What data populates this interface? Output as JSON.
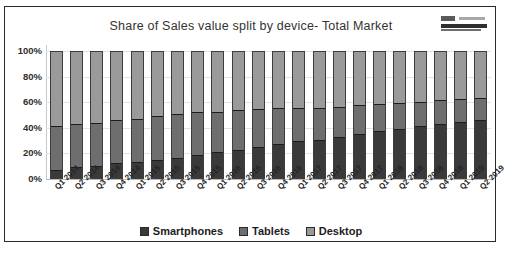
{
  "chart_data": {
    "type": "bar",
    "stacked": true,
    "stack_mode": "percent",
    "title": "Share of Sales value split by device- Total Market",
    "xlabel": "",
    "ylabel": "",
    "ylim": [
      0,
      100
    ],
    "ytick_labels": [
      "100%",
      "80%",
      "60%",
      "40%",
      "20%",
      "0%"
    ],
    "ytick_values": [
      100,
      80,
      60,
      40,
      20,
      0
    ],
    "grid": true,
    "legend_position": "bottom",
    "categories": [
      "Q1 2014",
      "Q2 2014",
      "Q3 2014",
      "Q4 2014",
      "Q1 2015",
      "Q2 2015",
      "Q3 2015",
      "Q4 2015",
      "Q1 2016",
      "Q2 2016",
      "Q3 2016",
      "Q4 2016",
      "Q1 2017",
      "Q2 2017",
      "Q3 2017",
      "Q4 2017",
      "Q1 2018",
      "Q2 2018",
      "Q3 2018",
      "Q4 2018",
      "Q1 2019",
      "Q2 2019"
    ],
    "series": [
      {
        "name": "Smartphones",
        "color": "#3a3a3a",
        "values": [
          6,
          8,
          9,
          11,
          12,
          14,
          15,
          18,
          20,
          22,
          24,
          27,
          29,
          30,
          32,
          35,
          37,
          39,
          41,
          43,
          44,
          46
        ]
      },
      {
        "name": "Tablets",
        "color": "#6e6e6e",
        "values": [
          34,
          34,
          34,
          34,
          34,
          34,
          35,
          34,
          32,
          31,
          30,
          28,
          26,
          25,
          24,
          22,
          21,
          20,
          19,
          18,
          18,
          17
        ]
      },
      {
        "name": "Desktop",
        "color": "#9a9a9a",
        "values": [
          60,
          58,
          57,
          55,
          54,
          52,
          50,
          48,
          48,
          47,
          46,
          45,
          45,
          45,
          44,
          43,
          42,
          41,
          40,
          39,
          38,
          37
        ]
      }
    ]
  },
  "legend": {
    "items": [
      {
        "label": "Smartphones",
        "color": "#3a3a3a"
      },
      {
        "label": "Tablets",
        "color": "#6e6e6e"
      },
      {
        "label": "Desktop",
        "color": "#9a9a9a"
      }
    ]
  },
  "logo": {
    "name": "brand-logo"
  }
}
